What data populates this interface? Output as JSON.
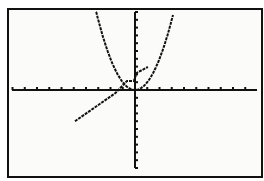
{
  "calculator": {
    "screen": "graph",
    "window": {
      "xmin": -10,
      "xmax": 10,
      "xscl": 1,
      "ymin": -10,
      "ymax": 10,
      "yscl": 1
    }
  },
  "colors": {
    "background": "#fbfbfa",
    "ink": "#111111",
    "border": "#111111"
  },
  "chart_data": {
    "type": "line",
    "title": "",
    "xlabel": "",
    "ylabel": "",
    "xlim": [
      -10,
      10
    ],
    "ylim": [
      -10,
      10
    ],
    "grid": false,
    "axes": {
      "x_ticks_every": 1,
      "y_ticks_every": 1
    },
    "series": [
      {
        "name": "Y1 = X^2",
        "x": [
          -3.2,
          -2.5,
          -2,
          -1.5,
          -1,
          -0.5,
          0,
          0.5,
          1,
          1.5,
          2,
          2.5,
          3.1
        ],
        "y": [
          10.24,
          6.25,
          4,
          2.25,
          1,
          0.25,
          0,
          0.25,
          1,
          2.25,
          4,
          6.25,
          9.61
        ]
      },
      {
        "name": "Y2 (line)",
        "x": [
          -4.9,
          -1.6,
          -0.65,
          -0.1,
          0.15,
          1.05
        ],
        "y": [
          -4.0,
          -0.4,
          1.15,
          1.15,
          2.2,
          2.95
        ]
      }
    ]
  }
}
